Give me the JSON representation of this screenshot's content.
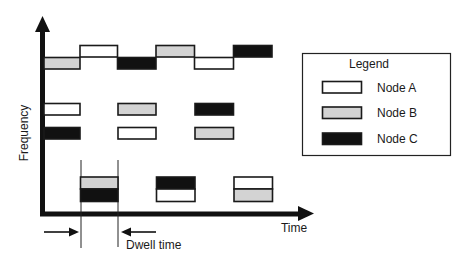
{
  "diagram": {
    "type": "frequency-hopping-timeline",
    "y_axis_label": "Frequency",
    "x_axis_label": "Time",
    "dwell_label": "Dwell time",
    "colors": {
      "node_a": "#ffffff",
      "node_b": "#d3d3d3",
      "node_c": "#111111",
      "stroke": "#1a1a1a"
    },
    "nodes": [
      {
        "id": "A",
        "label": "Node A",
        "fill": "#ffffff"
      },
      {
        "id": "B",
        "label": "Node B",
        "fill": "#d3d3d3"
      },
      {
        "id": "C",
        "label": "Node C",
        "fill": "#111111"
      }
    ],
    "legend": {
      "title": "Legend",
      "items": [
        {
          "node": "A",
          "label": "Node A"
        },
        {
          "node": "B",
          "label": "Node B"
        },
        {
          "node": "C",
          "label": "Node C"
        }
      ]
    },
    "bands": [
      {
        "name": "hopping-sequence",
        "slots": [
          {
            "slot": 0,
            "node": "B",
            "level": "low"
          },
          {
            "slot": 1,
            "node": "A",
            "level": "high"
          },
          {
            "slot": 2,
            "node": "C",
            "level": "low"
          },
          {
            "slot": 3,
            "node": "B",
            "level": "high"
          },
          {
            "slot": 4,
            "node": "A",
            "level": "low"
          },
          {
            "slot": 5,
            "node": "C",
            "level": "high"
          }
        ]
      },
      {
        "name": "channel-row-1",
        "slots": [
          {
            "slot": 0,
            "node": "A"
          },
          {
            "slot": 2,
            "node": "B"
          },
          {
            "slot": 4,
            "node": "C"
          }
        ]
      },
      {
        "name": "channel-row-2",
        "slots": [
          {
            "slot": 0,
            "node": "C"
          },
          {
            "slot": 2,
            "node": "A"
          },
          {
            "slot": 4,
            "node": "B"
          }
        ]
      },
      {
        "name": "stacked-row",
        "slots": [
          {
            "slot": 1,
            "top": "B",
            "bottom": "C"
          },
          {
            "slot": 3,
            "top": "C",
            "bottom": "A"
          },
          {
            "slot": 5,
            "top": "A",
            "bottom": "B"
          }
        ]
      }
    ],
    "dwell_slot": 1
  }
}
